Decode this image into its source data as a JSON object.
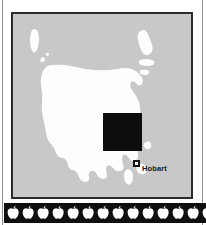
{
  "figure": {
    "colors": {
      "sea": "#c8c8c8",
      "land": "#fdfdfd",
      "frame": "#2b2b2b",
      "study_area": "#0d0d0d",
      "strip_background": "#0f0f0f",
      "apple": "#ffffff",
      "label_text": "#1a1a1a"
    }
  },
  "map": {
    "panel_name": "tasmania-map-panel",
    "sea_label": "",
    "landmasses": [
      {
        "name": "tasmania-mainland",
        "label": ""
      },
      {
        "name": "king-island",
        "label": ""
      },
      {
        "name": "flinders-island",
        "label": ""
      },
      {
        "name": "cape-barren-island",
        "label": ""
      },
      {
        "name": "clarke-island",
        "label": ""
      },
      {
        "name": "bruny-island",
        "label": ""
      },
      {
        "name": "maria-island",
        "label": ""
      }
    ],
    "study_area": {
      "name": "study-area-square",
      "label": "",
      "fill": "#0d0d0d"
    },
    "cities": [
      {
        "name": "hobart",
        "label": "Hobart",
        "marker": "square-dot-marker"
      }
    ]
  },
  "decoration": {
    "strip_name": "apple-border-strip",
    "icon": "apple-icon",
    "icon_count": 14,
    "label": ""
  }
}
